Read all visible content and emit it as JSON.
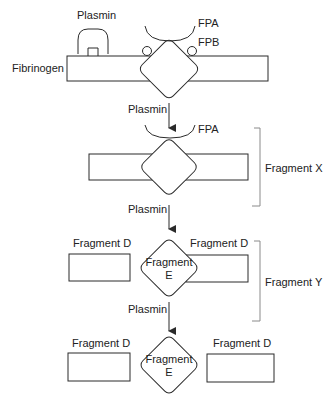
{
  "diagram": {
    "type": "biochemical degradation pathway",
    "stages": [
      {
        "name": "fibrinogen",
        "labels": {
          "molecule": "Fibrinogen",
          "enzyme": "Plasmin",
          "fpa": "FPA",
          "fpb": "FPB"
        }
      },
      {
        "name": "fragment-x",
        "labels": {
          "enzyme": "Plasmin",
          "fpa": "FPA",
          "bracket": "Fragment X"
        }
      },
      {
        "name": "fragment-y",
        "labels": {
          "enzyme": "Plasmin",
          "left_d": "Fragment D",
          "right_d": "Fragment D",
          "center_e_line1": "Fragment",
          "center_e_line2": "E",
          "bracket": "Fragment Y"
        }
      },
      {
        "name": "final-products",
        "labels": {
          "enzyme": "Plasmin",
          "left_d": "Fragment D",
          "right_d": "Fragment D",
          "center_e_line1": "Fragment",
          "center_e_line2": "E"
        }
      }
    ],
    "colors": {
      "stroke": "#2a2a2a",
      "bracket": "#8a8a8a",
      "background": "#ffffff"
    }
  }
}
